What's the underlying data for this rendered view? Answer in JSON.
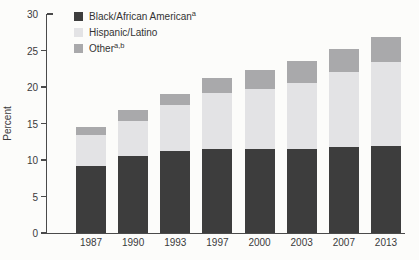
{
  "chart": {
    "ylabel": "Percent",
    "legend": [
      {
        "label": "Black/African American",
        "sup": "a",
        "color": "#3d3d3d"
      },
      {
        "label": "Hispanic/Latino",
        "sup": "",
        "color": "#e3e3e5"
      },
      {
        "label": "Other",
        "sup": "a,b",
        "color": "#a9a9ab"
      }
    ]
  },
  "chart_data": {
    "type": "bar",
    "stacked": true,
    "title": "",
    "xlabel": "",
    "ylabel": "Percent",
    "ylim": [
      0,
      30
    ],
    "yticks": [
      0,
      5,
      10,
      15,
      20,
      25,
      30
    ],
    "grid": false,
    "legend_position": "top-left",
    "categories": [
      "1987",
      "1990",
      "1993",
      "1997",
      "2000",
      "2003",
      "2007",
      "2013"
    ],
    "series": [
      {
        "name": "Black/African American",
        "color": "#3d3d3d",
        "values": [
          9.2,
          10.5,
          11.2,
          11.5,
          11.5,
          11.5,
          11.8,
          11.9
        ]
      },
      {
        "name": "Hispanic/Latino",
        "color": "#e3e3e5",
        "values": [
          4.2,
          4.9,
          6.3,
          7.7,
          8.2,
          9.1,
          10.2,
          11.5
        ]
      },
      {
        "name": "Other",
        "color": "#a9a9ab",
        "values": [
          1.1,
          1.4,
          1.6,
          2.0,
          2.7,
          2.9,
          3.2,
          3.5
        ]
      }
    ],
    "totals": [
      14.5,
      16.8,
      19.1,
      21.2,
      22.4,
      23.5,
      25.2,
      26.9
    ]
  }
}
